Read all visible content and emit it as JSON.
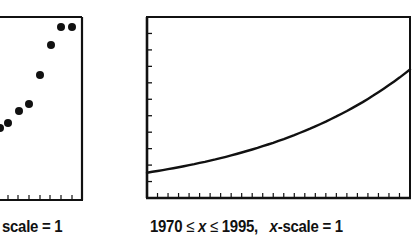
{
  "chart_data": [
    {
      "type": "scatter",
      "title": "",
      "caption_visible": "scale = 1",
      "xlabel": "",
      "ylabel": "",
      "note": "Left chart is cropped; only right portion visible",
      "points_px": [
        {
          "x": 0,
          "y": 128
        },
        {
          "x": 8,
          "y": 123
        },
        {
          "x": 19,
          "y": 111
        },
        {
          "x": 29,
          "y": 104
        },
        {
          "x": 40,
          "y": 75
        },
        {
          "x": 51,
          "y": 45
        },
        {
          "x": 61,
          "y": 27
        },
        {
          "x": 72,
          "y": 27
        }
      ],
      "x_ticks_px": [
        8,
        18,
        29,
        40,
        50,
        61,
        72
      ],
      "frame": {
        "right": 82,
        "top": 17,
        "bottom": 200
      }
    },
    {
      "type": "line",
      "title": "",
      "caption": {
        "range_lo": "1970",
        "le": "≤",
        "var": "x",
        "range_hi": "1995,",
        "scale_var": "x",
        "scale_text": "-scale = 1"
      },
      "x": [
        1970,
        1975,
        1980,
        1985,
        1990,
        1995
      ],
      "values_rel": [
        0.14,
        0.22,
        0.31,
        0.42,
        0.55,
        0.71
      ],
      "xlim": [
        1970,
        1995
      ],
      "x_scale": 1,
      "y_tick_count": 10,
      "x_tick_count": 25,
      "grid": false,
      "legend": null
    }
  ]
}
